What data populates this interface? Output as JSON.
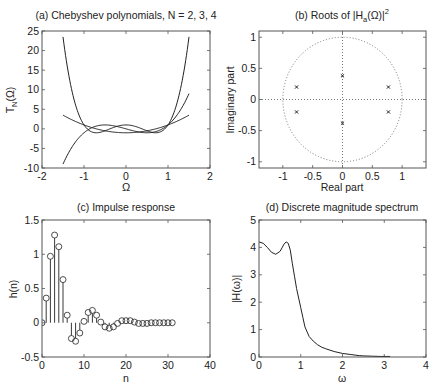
{
  "figure": {
    "width": 439,
    "height": 391,
    "line_color": "#222222",
    "frame_color": "#555555"
  },
  "chart_data": [
    {
      "id": "a",
      "type": "line",
      "title": "(a) Chebyshev polynomials, N = 2, 3, 4",
      "xlabel": "Ω",
      "ylabel": "T_N(Ω)",
      "ylabel_main": "T",
      "ylabel_sub": "N",
      "ylabel_tail": "(Ω)",
      "xlim": [
        -2,
        2
      ],
      "ylim": [
        -10,
        25
      ],
      "xticks": [
        -2,
        -1,
        0,
        1,
        2
      ],
      "yticks": [
        -10,
        -5,
        0,
        5,
        10,
        15,
        20,
        25
      ],
      "frame": {
        "x0": 42,
        "y0": 31,
        "x1": 210,
        "y1": 168
      },
      "grid": false,
      "domain": [
        -1.5,
        1.5
      ],
      "series": [
        {
          "name": "N = 2",
          "formula": "2x^2-1",
          "coeffs": [
            -1,
            0,
            2
          ]
        },
        {
          "name": "N = 3",
          "formula": "4x^3-3x",
          "coeffs": [
            0,
            -3,
            0,
            4
          ]
        },
        {
          "name": "N = 4",
          "formula": "8x^4-8x^2+1",
          "coeffs": [
            1,
            0,
            -8,
            0,
            8
          ]
        }
      ]
    },
    {
      "id": "b",
      "type": "scatter",
      "title_pre": "(b) Roots of |H",
      "title_sub": "a",
      "title_mid": "(Ω)|",
      "title_sup": "2",
      "title": "(b) Roots of |H_a(Ω)|^2",
      "xlabel": "Real part",
      "ylabel": "Imaginary part",
      "xlim": [
        -1.4,
        1.4
      ],
      "ylim": [
        -1.1,
        1.1
      ],
      "xticks": [
        -1,
        -0.5,
        0,
        0.5,
        1
      ],
      "yticks": [
        -1,
        -0.5,
        0,
        0.5,
        1
      ],
      "frame": {
        "x0": 259,
        "y0": 31,
        "x1": 426,
        "y1": 168
      },
      "unit_circle": true,
      "dotted_axes": true,
      "marker": "x",
      "points": [
        {
          "re": -0.77,
          "im": 0.2
        },
        {
          "re": -0.77,
          "im": -0.2
        },
        {
          "re": 0.77,
          "im": 0.2
        },
        {
          "re": 0.77,
          "im": -0.2
        },
        {
          "re": 0.0,
          "im": 0.38
        },
        {
          "re": 0.0,
          "im": -0.38
        }
      ]
    },
    {
      "id": "c",
      "type": "stem",
      "title": "(c) Impulse response",
      "xlabel": "n",
      "ylabel": "h(n)",
      "xlim": [
        0,
        40
      ],
      "ylim": [
        -0.5,
        1.5
      ],
      "xticks": [
        0,
        10,
        20,
        30,
        40
      ],
      "yticks": [
        -0.5,
        0,
        0.5,
        1,
        1.5
      ],
      "frame": {
        "x0": 42,
        "y0": 220,
        "x1": 210,
        "y1": 357
      },
      "marker": "o",
      "n": [
        0,
        1,
        2,
        3,
        4,
        5,
        6,
        7,
        8,
        9,
        10,
        11,
        12,
        13,
        14,
        15,
        16,
        17,
        18,
        19,
        20,
        21,
        22,
        23,
        24,
        25,
        26,
        27,
        28,
        29,
        30,
        31
      ],
      "values": [
        0.0,
        0.36,
        0.97,
        1.28,
        1.11,
        0.63,
        0.11,
        -0.23,
        -0.27,
        -0.15,
        0.02,
        0.15,
        0.18,
        0.11,
        0.01,
        -0.06,
        -0.08,
        -0.06,
        -0.01,
        0.03,
        0.03,
        0.03,
        0.01,
        -0.01,
        -0.01,
        -0.01,
        0.0,
        0.0,
        0.0,
        0.0,
        0.0,
        0.0
      ]
    },
    {
      "id": "d",
      "type": "line",
      "title": "(d) Discrete magnitude spectrum",
      "xlabel": "ω",
      "ylabel": "|H(ω)|",
      "xlim": [
        0,
        4
      ],
      "ylim": [
        0,
        5
      ],
      "xticks": [
        0,
        1,
        2,
        3,
        4
      ],
      "yticks": [
        0,
        1,
        2,
        3,
        4,
        5
      ],
      "frame": {
        "x0": 259,
        "y0": 220,
        "x1": 426,
        "y1": 357
      },
      "x": [
        0,
        0.1,
        0.2,
        0.3,
        0.4,
        0.5,
        0.55,
        0.6,
        0.65,
        0.7,
        0.75,
        0.8,
        0.85,
        0.9,
        0.95,
        1.0,
        1.05,
        1.1,
        1.2,
        1.3,
        1.4,
        1.5,
        1.6,
        1.8,
        2.0,
        2.2,
        2.4,
        2.5,
        2.7,
        2.9,
        3.14
      ],
      "y": [
        4.2,
        4.15,
        4.0,
        3.82,
        3.75,
        3.85,
        3.98,
        4.12,
        4.2,
        4.15,
        3.9,
        3.4,
        2.95,
        2.5,
        2.15,
        1.8,
        1.45,
        1.1,
        0.75,
        0.58,
        0.45,
        0.36,
        0.3,
        0.2,
        0.13,
        0.09,
        0.05,
        0.04,
        0.03,
        0.02,
        0.02
      ]
    }
  ]
}
